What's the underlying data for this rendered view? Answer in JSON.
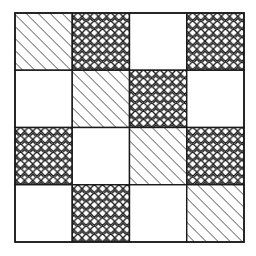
{
  "figure": {
    "background_color": "#ffffff",
    "line_color": "#1a1a1a",
    "grid": {
      "rows": 4,
      "columns": 4,
      "origin_x": 15,
      "origin_y": 13,
      "cell_width": 57.25,
      "cell_height": 57.25,
      "border_width": 1.6,
      "cell_border_width": 1.4
    },
    "fill_styles": {
      "diagonal": {
        "name": "diagonal-hatch",
        "label": "Diagonal hatch",
        "stroke": "#1a1a1a",
        "stroke_width": 1.15,
        "spacing": 8.5,
        "angle_deg": 45
      },
      "cross": {
        "name": "x-crosshatch",
        "label": "X cross-hatch lattice",
        "stroke": "#1a1a1a",
        "stroke_width": 1.3,
        "spacing": 8.2
      },
      "blank": {
        "name": "blank-fill",
        "label": "Blank",
        "fill": "#ffffff"
      }
    },
    "cells": [
      {
        "row": 0,
        "col": 0,
        "fill": "diagonal",
        "label": "R1C1"
      },
      {
        "row": 0,
        "col": 1,
        "fill": "cross",
        "label": "R1C2"
      },
      {
        "row": 0,
        "col": 2,
        "fill": "blank",
        "label": "R1C3"
      },
      {
        "row": 0,
        "col": 3,
        "fill": "cross",
        "label": "R1C4"
      },
      {
        "row": 1,
        "col": 0,
        "fill": "blank",
        "label": "R2C1"
      },
      {
        "row": 1,
        "col": 1,
        "fill": "diagonal",
        "label": "R2C2"
      },
      {
        "row": 1,
        "col": 2,
        "fill": "cross",
        "label": "R2C3"
      },
      {
        "row": 1,
        "col": 3,
        "fill": "blank",
        "label": "R2C4"
      },
      {
        "row": 2,
        "col": 0,
        "fill": "cross",
        "label": "R3C1"
      },
      {
        "row": 2,
        "col": 1,
        "fill": "blank",
        "label": "R3C2"
      },
      {
        "row": 2,
        "col": 2,
        "fill": "diagonal",
        "label": "R3C3"
      },
      {
        "row": 2,
        "col": 3,
        "fill": "cross",
        "label": "R3C4"
      },
      {
        "row": 3,
        "col": 0,
        "fill": "blank",
        "label": "R4C1"
      },
      {
        "row": 3,
        "col": 1,
        "fill": "cross",
        "label": "R4C2"
      },
      {
        "row": 3,
        "col": 2,
        "fill": "blank",
        "label": "R4C3"
      },
      {
        "row": 3,
        "col": 3,
        "fill": "diagonal",
        "label": "R4C4"
      }
    ]
  }
}
